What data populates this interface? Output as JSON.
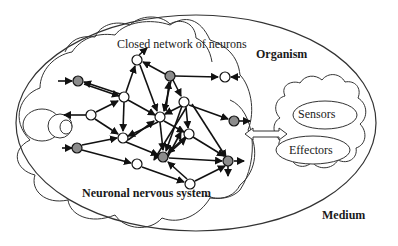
{
  "labels": {
    "closed_network": "Closed network of neurons",
    "organism": "Organism",
    "sensors": "Sensors",
    "effectors": "Effectors",
    "neuronal_system": "Neuronal nervous system",
    "medium": "Medium"
  },
  "colors": {
    "stroke": "#222222",
    "gray_node": "#8c8c8c",
    "white_node": "#ffffff"
  },
  "nodes": {
    "white": [
      [
        137,
        60
      ],
      [
        124,
        97
      ],
      [
        91,
        115
      ],
      [
        184,
        102
      ],
      [
        160,
        117
      ],
      [
        123,
        138
      ],
      [
        189,
        134
      ],
      [
        137,
        164
      ],
      [
        190,
        184
      ],
      [
        225,
        77
      ]
    ],
    "gray": [
      [
        78,
        81
      ],
      [
        170,
        76
      ],
      [
        77,
        148
      ],
      [
        163,
        157
      ],
      [
        234,
        121
      ],
      [
        228,
        161
      ]
    ]
  }
}
